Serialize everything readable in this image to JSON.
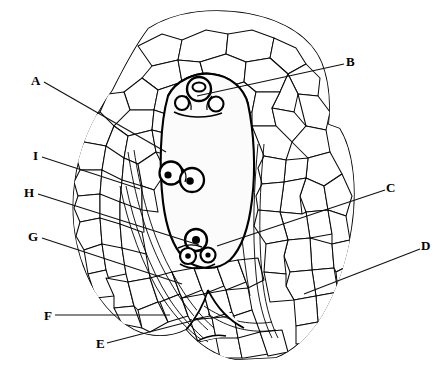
{
  "figure": {
    "background_color": "#ffffff",
    "ink_color": "#000000",
    "width": 447,
    "height": 369
  },
  "labels": [
    {
      "id": "A",
      "text": "A",
      "x": 31,
      "y": 74,
      "side": "left",
      "leader": {
        "from_x": 44,
        "from_y": 82,
        "to_x": 166,
        "to_y": 152
      }
    },
    {
      "id": "B",
      "text": "B",
      "x": 346,
      "y": 55,
      "side": "right",
      "leader": {
        "from_x": 344,
        "from_y": 64,
        "to_x": 197,
        "to_y": 96
      }
    },
    {
      "id": "I",
      "text": "I",
      "x": 33,
      "y": 149,
      "side": "left",
      "leader": {
        "from_x": 42,
        "from_y": 157,
        "to_x": 140,
        "to_y": 189
      }
    },
    {
      "id": "H",
      "text": "H",
      "x": 24,
      "y": 186,
      "side": "left",
      "leader": {
        "from_x": 38,
        "from_y": 194,
        "to_x": 199,
        "to_y": 245
      }
    },
    {
      "id": "C",
      "text": "C",
      "x": 386,
      "y": 181,
      "side": "right",
      "leader": {
        "from_x": 385,
        "from_y": 190,
        "to_x": 217,
        "to_y": 246
      }
    },
    {
      "id": "G",
      "text": "G",
      "x": 28,
      "y": 230,
      "side": "left",
      "leader": {
        "from_x": 42,
        "from_y": 238,
        "to_x": 182,
        "to_y": 284
      }
    },
    {
      "id": "D",
      "text": "D",
      "x": 421,
      "y": 239,
      "side": "right",
      "leader": {
        "from_x": 420,
        "from_y": 249,
        "to_x": 304,
        "to_y": 294
      }
    },
    {
      "id": "F",
      "text": "F",
      "x": 44,
      "y": 309,
      "side": "left",
      "leader": {
        "from_x": 55,
        "from_y": 315,
        "to_x": 170,
        "to_y": 315
      }
    },
    {
      "id": "E",
      "text": "E",
      "x": 96,
      "y": 337,
      "side": "left",
      "leader": {
        "from_x": 107,
        "from_y": 343,
        "to_x": 203,
        "to_y": 318
      }
    }
  ],
  "label_order": [
    "A",
    "B",
    "I",
    "H",
    "C",
    "G",
    "D",
    "F",
    "E"
  ],
  "structures": {
    "embryo_sac": "central stippled oval",
    "apical_cells": "egg apparatus at top of sac",
    "polar_nuclei": "two nuclei at center of sac",
    "antipodal_cells": "cell group at base of sac",
    "surrounding_tissue": "polygonal cell network"
  }
}
